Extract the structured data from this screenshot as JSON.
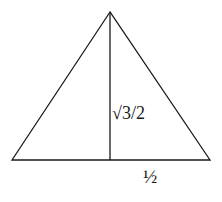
{
  "diagram": {
    "type": "equilateral-triangle-altitude",
    "shape": {
      "apex": [
        110,
        12
      ],
      "base_left": [
        12,
        160
      ],
      "base_right": [
        210,
        160
      ],
      "altitude_foot": [
        110,
        160
      ]
    },
    "labels": {
      "height": "√3/2",
      "half_base": "½"
    },
    "colors": {
      "stroke": "#1a1a1a",
      "background": "#ffffff"
    }
  }
}
